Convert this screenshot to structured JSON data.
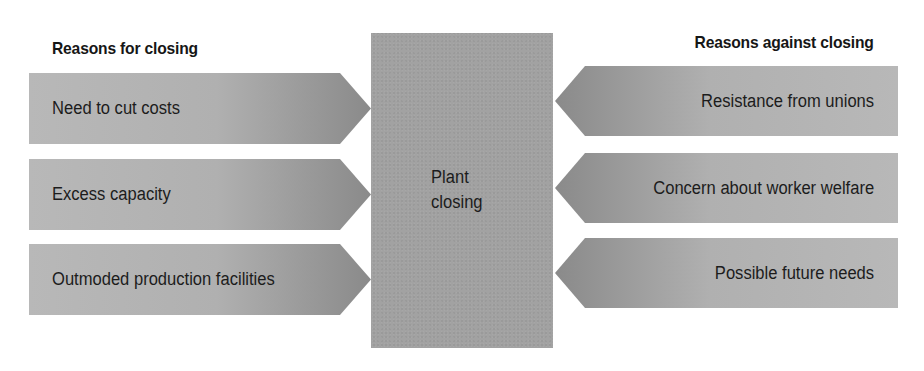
{
  "diagram": {
    "type": "force-field",
    "center": {
      "line1": "Plant",
      "line2": "closing",
      "color": "#a2a2a2"
    },
    "left_column": {
      "heading": "Reasons for closing",
      "items": [
        {
          "label": "Need to cut costs"
        },
        {
          "label": "Excess capacity"
        },
        {
          "label": "Outmoded production facilities"
        }
      ],
      "gradient": {
        "light": "#b9b9b9",
        "dark": "#8a8a8a"
      }
    },
    "right_column": {
      "heading": "Reasons against closing",
      "items": [
        {
          "label": "Resistance from unions"
        },
        {
          "label": "Concern about worker welfare"
        },
        {
          "label": "Possible future needs"
        }
      ],
      "gradient": {
        "light": "#b9b9b9",
        "dark": "#8a8a8a"
      }
    }
  }
}
